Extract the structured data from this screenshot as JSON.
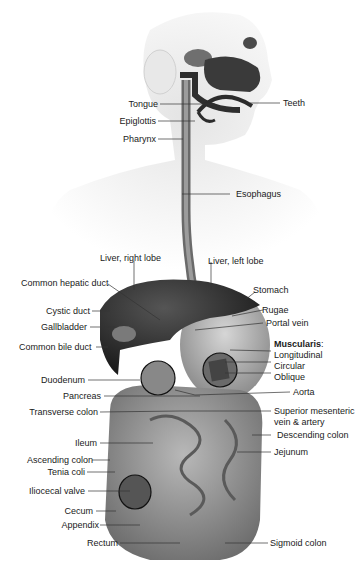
{
  "figure": {
    "colors": {
      "background": "#ffffff",
      "organ_dark": "#2b2b2b",
      "organ_mid": "#8a8a8a",
      "organ_light": "#bdbdbd",
      "label": "#1a1a1a",
      "leader": "#333333"
    }
  },
  "labels": {
    "head": {
      "tongue": "Tongue",
      "teeth": "Teeth",
      "epiglottis": "Epiglottis",
      "pharynx": "Pharynx"
    },
    "esophagus": "Esophagus",
    "liver_right_lobe": "Liver, right lobe",
    "liver_left_lobe": "Liver, left lobe",
    "common_hepatic_duct": "Common hepatic duct",
    "stomach": "Stomach",
    "cystic_duct": "Cystic duct",
    "rugae": "Rugae",
    "gallbladder": "Gallbladder",
    "portal_vein": "Portal vein",
    "common_bile_duct": "Common bile duct",
    "muscularis": {
      "heading": "Muscularis",
      "colon": ":",
      "layers": [
        "Longitudinal",
        "Circular",
        "Oblique"
      ]
    },
    "duodenum": "Duodenum",
    "pancreas": "Pancreas",
    "aorta": "Aorta",
    "transverse_colon": "Transverse colon",
    "superior_mesenteric_1": "Superior mesenteric",
    "superior_mesenteric_2": "vein & artery",
    "descending_colon": "Descending colon",
    "ileum": "Ileum",
    "jejunum": "Jejunum",
    "ascending_colon": "Ascending colon",
    "tenia_coli": "Tenia coli",
    "iliocecal_valve": "Iliocecal valve",
    "cecum": "Cecum",
    "appendix": "Appendix",
    "rectum": "Rectum",
    "sigmoid_colon": "Sigmoid colon"
  }
}
